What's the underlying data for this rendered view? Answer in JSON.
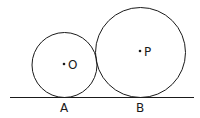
{
  "diagram": {
    "type": "geometry",
    "colors": {
      "stroke": "#1a1a1a",
      "background": "#ffffff"
    },
    "line": {
      "x1": 10,
      "y1": 97.5,
      "x2": 194,
      "y2": 97.5
    },
    "circles": [
      {
        "name": "small",
        "center_label": "O",
        "cx": 64.5,
        "cy": 65,
        "r": 32.5,
        "tangent_point_label": "A"
      },
      {
        "name": "large",
        "center_label": "P",
        "cx": 140.5,
        "cy": 52.5,
        "r": 45,
        "tangent_point_label": "B"
      }
    ],
    "labels": {
      "O": "O",
      "P": "P",
      "A": "A",
      "B": "B"
    }
  }
}
